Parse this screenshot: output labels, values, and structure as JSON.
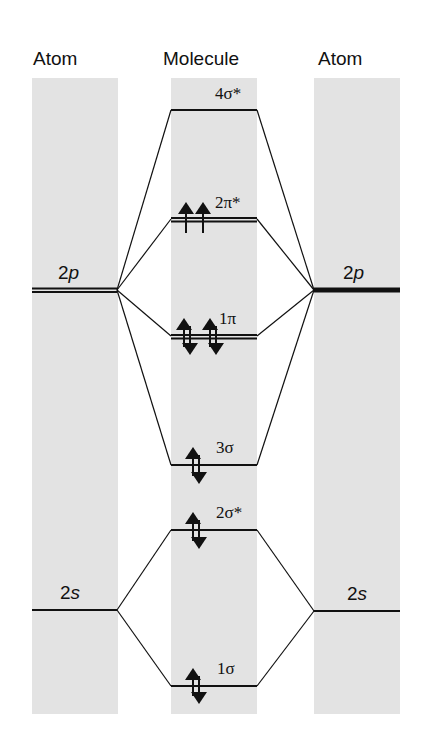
{
  "headers": {
    "left": "Atom",
    "middle": "Molecule",
    "right": "Atom"
  },
  "atomic_orbitals": {
    "left": [
      {
        "num": "2",
        "sym": "p",
        "y": 290,
        "style": "double"
      },
      {
        "num": "2",
        "sym": "s",
        "y": 610,
        "style": "single"
      }
    ],
    "right": [
      {
        "num": "2",
        "sym": "p",
        "y": 290,
        "style": "thick"
      },
      {
        "num": "2",
        "sym": "s",
        "y": 611,
        "style": "single"
      }
    ]
  },
  "molecular_orbitals": [
    {
      "label": "4σ*",
      "y": 110,
      "style": "single",
      "electrons": []
    },
    {
      "label": "2π*",
      "y": 219,
      "style": "double",
      "electrons": [
        "up",
        "up"
      ]
    },
    {
      "label": "1π",
      "y": 336,
      "style": "double",
      "electrons": [
        "pair",
        "pair"
      ]
    },
    {
      "label": "3σ",
      "y": 465,
      "style": "single",
      "electrons": [
        "pair"
      ]
    },
    {
      "label": "2σ*",
      "y": 530,
      "style": "single",
      "electrons": [
        "pair"
      ]
    },
    {
      "label": "1σ",
      "y": 686,
      "style": "single",
      "electrons": [
        "pair"
      ]
    }
  ],
  "colors": {
    "column_bg": "#e3e3e3",
    "line": "#111111"
  }
}
